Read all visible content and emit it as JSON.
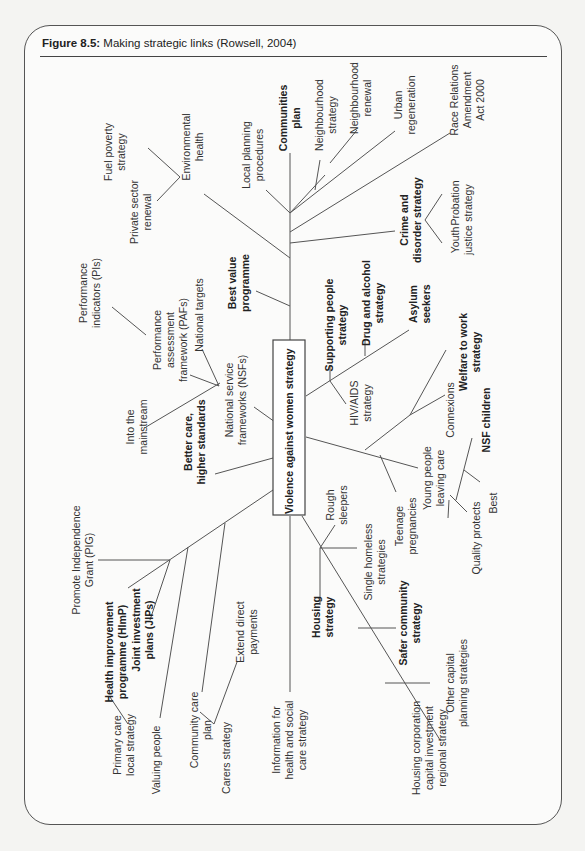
{
  "figure": {
    "label": "Figure 8.5:",
    "title": "Making strategic links (Rowsell, 2004)"
  },
  "center": {
    "label": "Violence against women strategy"
  },
  "nodes": {
    "fuel_poverty": [
      "Fuel poverty",
      "strategy"
    ],
    "private_sector": [
      "Private sector",
      "renewal"
    ],
    "env_health": [
      "Environmental",
      "health"
    ],
    "local_planning": [
      "Local planning",
      "procedures"
    ],
    "communities_plan": [
      "Communities",
      "plan"
    ],
    "neighbourhood_strategy": [
      "Neighbourhood",
      "strategy"
    ],
    "neighbourhood_renewal": [
      "Neighbourhood",
      "renewal"
    ],
    "urban_regeneration": [
      "Urban",
      "regeneration"
    ],
    "race_relations": [
      "Race Relations",
      "Amendment",
      "Act 2000"
    ],
    "crime_disorder": [
      "Crime and",
      "disorder strategy"
    ],
    "probation": [
      "Probation",
      "strategy"
    ],
    "youth_justice": [
      "Youth",
      "justice"
    ],
    "performance_indicators": [
      "Performance",
      "indicators (PIs)"
    ],
    "paf": [
      "Performance",
      "assessment",
      "framework (PAFs)"
    ],
    "national_targets": [
      "National targets"
    ],
    "best_value": [
      "Best value",
      "programme"
    ],
    "into_mainstream": [
      "Into the",
      "mainstream"
    ],
    "nsf": [
      "National service",
      "frameworks (NSFs)"
    ],
    "supporting_people": [
      "Supporting people",
      "strategy"
    ],
    "drug_alcohol": [
      "Drug and alcohol",
      "strategy"
    ],
    "asylum": [
      "Asylum",
      "seekers"
    ],
    "hiv_aids": [
      "HIV/AIDS",
      "strategy"
    ],
    "welfare_work": [
      "Welfare to work",
      "strategy"
    ],
    "connexions": [
      "Connexions"
    ],
    "nsf_children": [
      "NSF children"
    ],
    "better_care": [
      "Better care,",
      "higher standards"
    ],
    "young_people": [
      "Young people",
      "leaving care"
    ],
    "teenage_preg": [
      "Teenage",
      "pregnancies"
    ],
    "best": [
      "Best"
    ],
    "quality_protects": [
      "Quality protects"
    ],
    "rough_sleepers": [
      "Rough",
      "sleepers"
    ],
    "single_homeless": [
      "Single homeless",
      "strategies"
    ],
    "housing_strategy": [
      "Housing",
      "strategy"
    ],
    "safer_community": [
      "Safer community",
      "strategy"
    ],
    "other_capital": [
      "Other capital",
      "planning strategies"
    ],
    "housing_corp": [
      "Housing corporation",
      "capital investment",
      "regional strategy"
    ],
    "info_health": [
      "Information for",
      "health and social",
      "care strategy"
    ],
    "pig": [
      "Promote Independence",
      "Grant (PIG)"
    ],
    "himp": [
      "Health improvement",
      "programme (HImP)"
    ],
    "jip": [
      "Joint investment",
      "plans (JIPs)"
    ],
    "primary_care": [
      "Primary care",
      "local strategy"
    ],
    "valuing_people": [
      "Valuing people"
    ],
    "community_care": [
      "Community care",
      "plan"
    ],
    "extend_direct": [
      "Extend direct",
      "payments"
    ],
    "carers": [
      "Carers strategy"
    ]
  }
}
